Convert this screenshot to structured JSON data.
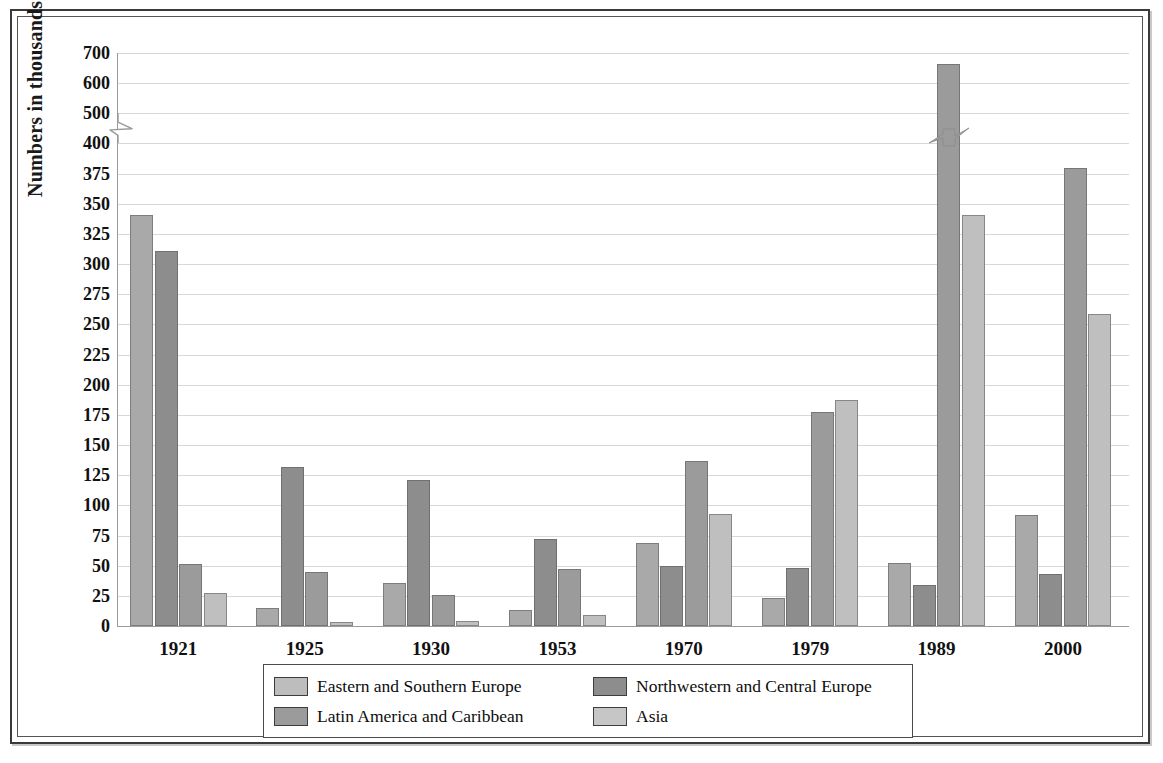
{
  "chart_data": {
    "type": "bar",
    "title": "",
    "xlabel": "",
    "ylabel": "Numbers in thousands",
    "categories": [
      "1921",
      "1925",
      "1930",
      "1953",
      "1970",
      "1979",
      "1989",
      "2000"
    ],
    "series": [
      {
        "name": "Eastern and Southern Europe",
        "color": "#a9a9a9",
        "values": [
          341,
          15,
          36,
          13,
          69,
          23,
          52,
          92
        ]
      },
      {
        "name": "Northwestern and Central Europe",
        "color": "#8d8d8d",
        "values": [
          311,
          132,
          121,
          72,
          50,
          48,
          34,
          43
        ]
      },
      {
        "name": "Latin America and Caribbean",
        "color": "#9b9b9b",
        "values": [
          51,
          45,
          26,
          47,
          137,
          177,
          665,
          380
        ]
      },
      {
        "name": "Asia",
        "color": "#bfbfbf",
        "values": [
          27,
          3,
          4,
          9,
          93,
          187,
          341,
          259
        ]
      }
    ],
    "ytick_labels": [
      "0",
      "25",
      "50",
      "75",
      "100",
      "125",
      "150",
      "175",
      "200",
      "225",
      "250",
      "275",
      "300",
      "325",
      "350",
      "375",
      "400",
      "500",
      "600",
      "700"
    ],
    "ytick_values": [
      0,
      25,
      50,
      75,
      100,
      125,
      150,
      175,
      200,
      225,
      250,
      275,
      300,
      325,
      350,
      375,
      400,
      500,
      600,
      700
    ],
    "axis_break": {
      "present": true,
      "between": [
        400,
        500
      ],
      "note": "broken y-axis scale"
    },
    "bar_break": {
      "present": true,
      "category": "1989",
      "series": "Latin America and Caribbean"
    },
    "ylim": [
      0,
      700
    ],
    "grid": true,
    "legend_position": "bottom"
  },
  "legend": {
    "items": [
      {
        "label": "Eastern and Southern Europe",
        "swatch": "s0"
      },
      {
        "label": "Northwestern and Central Europe",
        "swatch": "s1"
      },
      {
        "label": "Latin America and Caribbean",
        "swatch": "s2"
      },
      {
        "label": "Asia",
        "swatch": "s3"
      }
    ]
  }
}
